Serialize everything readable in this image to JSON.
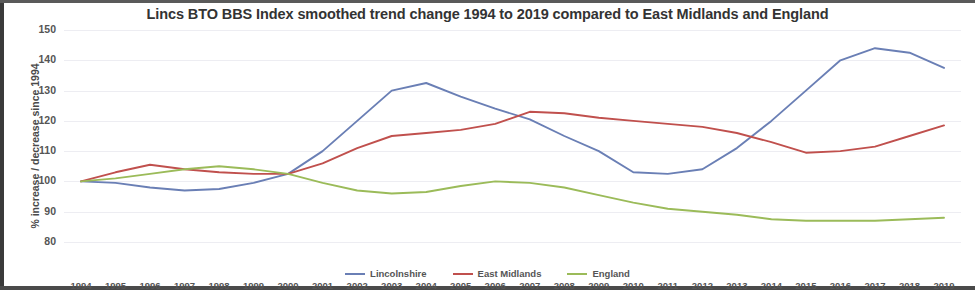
{
  "chart_data": {
    "type": "line",
    "title": "Lincs BTO BBS Index smoothed trend change 1994 to 2019 compared to East Midlands and England",
    "xlabel": "",
    "ylabel": "% increase / decrease since 1994",
    "x": [
      1994,
      1995,
      1996,
      1997,
      1998,
      1999,
      2000,
      2001,
      2002,
      2003,
      2004,
      2005,
      2006,
      2007,
      2008,
      2009,
      2010,
      2011,
      2012,
      2013,
      2014,
      2015,
      2016,
      2017,
      2018,
      2019
    ],
    "categories": [
      "1994",
      "1995",
      "1996",
      "1997",
      "1998",
      "1999",
      "2000",
      "2001",
      "2002",
      "2003",
      "2004",
      "2005",
      "2006",
      "2007",
      "2008",
      "2009",
      "2010",
      "2011",
      "2012",
      "2013",
      "2014",
      "2015",
      "2016",
      "2017",
      "2018",
      "2019"
    ],
    "ylim": [
      80,
      150
    ],
    "yticks": [
      80,
      90,
      100,
      110,
      120,
      130,
      140,
      150
    ],
    "grid": true,
    "legend_position": "bottom",
    "series": [
      {
        "name": "Lincolnshire",
        "color": "#6a7fb5",
        "values": [
          100,
          99.5,
          98,
          97,
          97.5,
          99.5,
          102.5,
          110,
          120,
          130,
          132.5,
          128,
          124,
          120.5,
          115,
          110,
          103,
          102.5,
          104,
          111,
          120,
          130,
          140,
          144,
          142.5,
          137.5
        ]
      },
      {
        "name": "East Midlands",
        "color": "#c0504d",
        "values": [
          100,
          103,
          105.5,
          104,
          103,
          102.5,
          102.5,
          106,
          111,
          115,
          116,
          117,
          119,
          123,
          122.5,
          121,
          120,
          119,
          118,
          116,
          113,
          109.5,
          110,
          111.5,
          115,
          118.5
        ]
      },
      {
        "name": "England",
        "color": "#9bbb59",
        "values": [
          100,
          101,
          102.5,
          104,
          105,
          104,
          102.5,
          99.5,
          97,
          96,
          96.5,
          98.5,
          100,
          99.5,
          98,
          95.5,
          93,
          91,
          90,
          89,
          87.5,
          87,
          87,
          87,
          87.5,
          88
        ]
      }
    ]
  },
  "legend": {
    "items": [
      {
        "label": "Lincolnshire",
        "color": "#6a7fb5"
      },
      {
        "label": "East Midlands",
        "color": "#c0504d"
      },
      {
        "label": "England",
        "color": "#9bbb59"
      }
    ]
  }
}
